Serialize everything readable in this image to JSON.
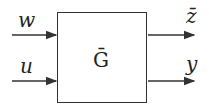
{
  "block": {
    "label": "Ḡ"
  },
  "inputs": [
    {
      "label": "w"
    },
    {
      "label": "u"
    }
  ],
  "outputs": [
    {
      "label": "z̄"
    },
    {
      "label": "y"
    }
  ]
}
